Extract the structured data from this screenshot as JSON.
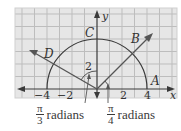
{
  "diagram": {
    "axes": {
      "x_label": "x",
      "y_label": "y",
      "x_ticks": [
        "−4",
        "−2",
        "2",
        "4"
      ],
      "y_tick": "2"
    },
    "points": {
      "A": "A",
      "B": "B",
      "C": "C",
      "D": "D"
    },
    "captions": {
      "left": {
        "numerator": "π",
        "denominator": "3",
        "text": "radians"
      },
      "right": {
        "numerator": "π",
        "denominator": "4",
        "text": "radians"
      }
    },
    "colors": {
      "grid_bg": "#e6e6e6",
      "grid_line": "#bdbdbd",
      "axis": "#3a3a3a",
      "curve": "#3a3a3a",
      "arrow": "#555555",
      "text": "#333333"
    },
    "geometry": {
      "circle_radius_units": 4,
      "ray_B_angle": "π/4",
      "ray_D_angle_from_y_axis": "π/3"
    }
  }
}
